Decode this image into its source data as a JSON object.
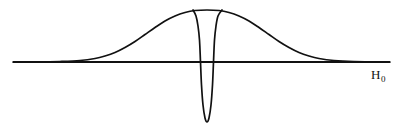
{
  "figure": {
    "background_color": "#ffffff",
    "line_color": "#111111",
    "width": 403,
    "height": 127,
    "x_axis_label_symbol": "H",
    "x_axis_label_subscript": "0"
  },
  "chart_data": {
    "type": "line",
    "title": "",
    "subtitle": "",
    "xlabel": "H0",
    "ylabel": "",
    "grid": false,
    "legend": null,
    "axis": {
      "baseline_y": 62,
      "x_start": 13,
      "x_end": 390,
      "ylim": [
        -1.95,
        1.25
      ],
      "xlim": [
        0,
        403
      ]
    },
    "series": [
      {
        "name": "broad-lineshape",
        "shape": "gaussian",
        "center_x": 207,
        "peak_y": 10,
        "peak_height": 52,
        "half_width_px": 62,
        "left_foot_x": 95,
        "right_foot_x": 312,
        "points": [
          {
            "x": 13,
            "y": 62
          },
          {
            "x": 40,
            "y": 62
          },
          {
            "x": 60,
            "y": 61.5
          },
          {
            "x": 80,
            "y": 60.5
          },
          {
            "x": 95,
            "y": 58.5
          },
          {
            "x": 105,
            "y": 56
          },
          {
            "x": 115,
            "y": 52.5
          },
          {
            "x": 125,
            "y": 47.5
          },
          {
            "x": 135,
            "y": 41.5
          },
          {
            "x": 145,
            "y": 34.5
          },
          {
            "x": 155,
            "y": 27.5
          },
          {
            "x": 165,
            "y": 21
          },
          {
            "x": 175,
            "y": 16
          },
          {
            "x": 185,
            "y": 12.5
          },
          {
            "x": 195,
            "y": 10.5
          },
          {
            "x": 207,
            "y": 10
          },
          {
            "x": 219,
            "y": 10.5
          },
          {
            "x": 229,
            "y": 12.5
          },
          {
            "x": 239,
            "y": 16
          },
          {
            "x": 249,
            "y": 21
          },
          {
            "x": 259,
            "y": 27.5
          },
          {
            "x": 269,
            "y": 34.5
          },
          {
            "x": 279,
            "y": 41.5
          },
          {
            "x": 289,
            "y": 47.5
          },
          {
            "x": 299,
            "y": 52.5
          },
          {
            "x": 309,
            "y": 56
          },
          {
            "x": 319,
            "y": 58.5
          },
          {
            "x": 334,
            "y": 60.5
          },
          {
            "x": 354,
            "y": 61.5
          },
          {
            "x": 390,
            "y": 62
          }
        ]
      },
      {
        "name": "central-hole",
        "shape": "inverted-lorentzian-spike",
        "center_x": 207,
        "top_y": 10,
        "bottom_y": 122,
        "depth_px": 112,
        "width_at_top_px": 29,
        "width_at_baseline_px": 16,
        "points": [
          {
            "x": 193,
            "y": 10
          },
          {
            "x": 196,
            "y": 16
          },
          {
            "x": 198,
            "y": 26
          },
          {
            "x": 199.5,
            "y": 40
          },
          {
            "x": 200.5,
            "y": 62
          },
          {
            "x": 201.5,
            "y": 85
          },
          {
            "x": 203,
            "y": 105
          },
          {
            "x": 205,
            "y": 118
          },
          {
            "x": 207,
            "y": 122
          },
          {
            "x": 209,
            "y": 118
          },
          {
            "x": 211,
            "y": 105
          },
          {
            "x": 212.5,
            "y": 85
          },
          {
            "x": 213.5,
            "y": 62
          },
          {
            "x": 214.5,
            "y": 40
          },
          {
            "x": 216,
            "y": 26
          },
          {
            "x": 218,
            "y": 16
          },
          {
            "x": 222,
            "y": 10
          }
        ]
      }
    ]
  }
}
